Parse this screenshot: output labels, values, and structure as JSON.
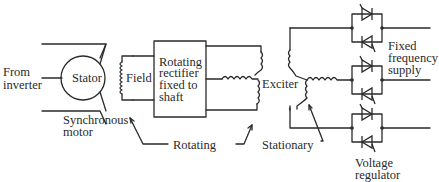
{
  "diagram": {
    "type": "brushless synchronous motor excitation schematic",
    "labels": {
      "from_inverter_line1": "From",
      "from_inverter_line2": "inverter",
      "stator": "Stator",
      "field": "Field",
      "rectifier_line1": "Rotating",
      "rectifier_line2": "rectifier",
      "rectifier_line3": "fixed to",
      "rectifier_line4": "shaft",
      "exciter": "Exciter",
      "synchronous_line1": "Synchronous",
      "synchronous_line2": "motor",
      "rotating": "Rotating",
      "stationary": "Stationary",
      "fixed_line1": "Fixed",
      "fixed_line2": "frequency",
      "fixed_line3": "supply",
      "voltage_line1": "Voltage",
      "voltage_line2": "regulator"
    },
    "components": [
      {
        "id": "stator",
        "kind": "circle",
        "label": "Stator"
      },
      {
        "id": "field",
        "kind": "coil",
        "label": "Field"
      },
      {
        "id": "rotating-rectifier",
        "kind": "box",
        "label": "Rotating rectifier fixed to shaft"
      },
      {
        "id": "exciter-rotor",
        "kind": "wye-winding",
        "group": "Rotating"
      },
      {
        "id": "exciter-stator",
        "kind": "wye-winding",
        "group": "Stationary"
      },
      {
        "id": "thyristor-pairs",
        "kind": "antiparallel-thyristors",
        "count": 3,
        "label": "Voltage regulator"
      }
    ],
    "colors": {
      "ink": "#2a2a2a",
      "background": "#ffffff"
    }
  }
}
